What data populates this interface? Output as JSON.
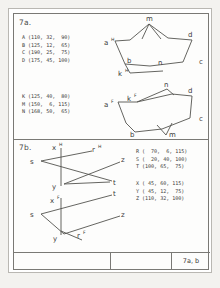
{
  "sheet": {
    "title_block": {
      "drawing_number": "7a, b"
    }
  },
  "panels": [
    {
      "id": "7a",
      "label": "7a.",
      "coordinate_lists": [
        {
          "name": "points-a-d",
          "text": "A (110, 32,  90)\nB (125, 12,  65)\nC (190, 25,  75)\nD (175, 45, 100)",
          "points": [
            {
              "label": "A",
              "x": 110,
              "y": 32,
              "z": 90
            },
            {
              "label": "B",
              "x": 125,
              "y": 12,
              "z": 65
            },
            {
              "label": "C",
              "x": 190,
              "y": 25,
              "z": 75
            },
            {
              "label": "D",
              "x": 175,
              "y": 45,
              "z": 100
            }
          ]
        },
        {
          "name": "points-k-m-n",
          "text": "K (125, 40,  80)\nM (150,  6, 115)\nN (168, 50,  65)",
          "points": [
            {
              "label": "K",
              "x": 125,
              "y": 40,
              "z": 80
            },
            {
              "label": "M",
              "x": 150,
              "y": 6,
              "z": 115
            },
            {
              "label": "N",
              "x": 168,
              "y": 50,
              "z": 65
            }
          ]
        }
      ],
      "figures": [
        {
          "name": "top-view-quadrilateral",
          "vertex_labels": [
            "a",
            "b",
            "c",
            "d",
            "m",
            "n",
            "k"
          ],
          "superscripts": {
            "a": "H",
            "k": "H"
          }
        },
        {
          "name": "front-view-quadrilateral",
          "vertex_labels": [
            "a",
            "b",
            "c",
            "d",
            "m",
            "n",
            "k"
          ],
          "superscripts": {
            "a": "F",
            "k": "F"
          }
        }
      ]
    },
    {
      "id": "7b",
      "label": "7b.",
      "coordinate_lists": [
        {
          "name": "points-r-s-t",
          "text": "R (  70,  6, 115)\nS (  20, 40, 100)\nT (100, 65,  75)",
          "points": [
            {
              "label": "R",
              "x": 70,
              "y": 6,
              "z": 115
            },
            {
              "label": "S",
              "x": 20,
              "y": 40,
              "z": 100
            },
            {
              "label": "T",
              "x": 100,
              "y": 65,
              "z": 75
            }
          ]
        },
        {
          "name": "points-x-y-z",
          "text": "X ( 45, 60, 115)\nY ( 45, 12,  75)\nZ (110, 32, 100)",
          "points": [
            {
              "label": "X",
              "x": 45,
              "y": 60,
              "z": 115
            },
            {
              "label": "Y",
              "x": 45,
              "y": 12,
              "z": 75
            },
            {
              "label": "Z",
              "x": 110,
              "y": 32,
              "z": 100
            }
          ]
        }
      ],
      "figures": [
        {
          "name": "top-view-lines",
          "labels": [
            "x",
            "r",
            "s",
            "z",
            "y",
            "t"
          ],
          "superscripts": {
            "x": "H",
            "r": "H"
          }
        },
        {
          "name": "front-view-lines",
          "labels": [
            "x",
            "t",
            "s",
            "z",
            "y",
            "r"
          ],
          "superscripts": {
            "x": "F",
            "r": "F"
          }
        }
      ]
    }
  ],
  "figure_labels": {
    "a": "a",
    "b": "b",
    "c": "c",
    "d": "d",
    "k": "k",
    "m": "m",
    "n": "n",
    "r": "r",
    "s": "s",
    "t": "t",
    "x": "x",
    "y": "y",
    "z": "z",
    "sup_h": "H",
    "sup_f": "F"
  }
}
